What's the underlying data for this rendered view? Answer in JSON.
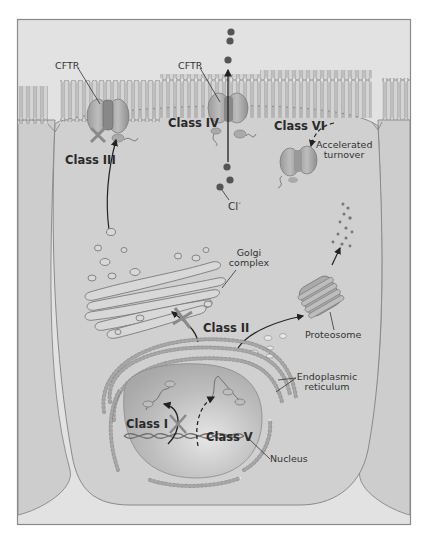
{
  "figure": {
    "background": "#d9d9d9",
    "frame_color": "#8a8a8a",
    "cell_fill": "#cfcfcf",
    "ink": "#333333"
  },
  "labels": {
    "cftr_left": "CFTR",
    "cftr_center": "CFTR",
    "class_iii": "Class III",
    "class_iv": "Class IV",
    "class_vi": "Class VI",
    "accelerated_turnover_line1": "Accelerated",
    "accelerated_turnover_line2": "turnover",
    "chloride": "Cl",
    "chloride_sup": "-",
    "golgi_line1": "Golgi",
    "golgi_line2": "complex",
    "class_ii": "Class II",
    "proteosome": "Proteosome",
    "er_line1": "Endoplasmic",
    "er_line2": "reticulum",
    "class_i": "Class I",
    "class_v": "Class V",
    "nucleus": "Nucleus"
  }
}
